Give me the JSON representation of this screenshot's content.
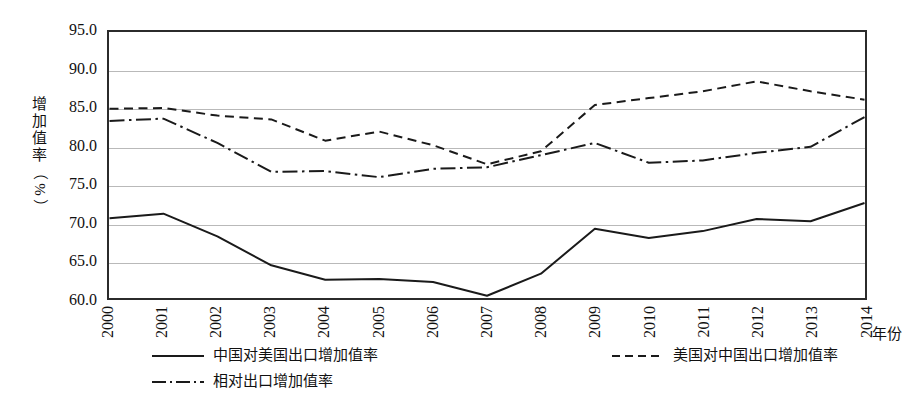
{
  "axes": {
    "y_title_chars": [
      "增",
      "加",
      "值",
      "率",
      "（",
      "%",
      "）"
    ],
    "y_title_text": "增加值率（%）",
    "x_title": "年份",
    "y_ticks": [
      "95.0",
      "90.0",
      "85.0",
      "80.0",
      "75.0",
      "70.0",
      "65.0",
      "60.0"
    ],
    "x_ticks": [
      "2000",
      "2001",
      "2002",
      "2003",
      "2004",
      "2005",
      "2006",
      "2007",
      "2008",
      "2009",
      "2010",
      "2011",
      "2012",
      "2013",
      "2014"
    ]
  },
  "legend": {
    "items": [
      {
        "label": "中国对美国出口增加值率",
        "style": "solid"
      },
      {
        "label": "美国对中国出口增加值率",
        "style": "dashed"
      },
      {
        "label": "相对出口增加值率",
        "style": "dashdot"
      }
    ]
  },
  "chart_data": {
    "type": "line",
    "title": "",
    "xlabel": "年份",
    "ylabel": "增加值率（%）",
    "x": [
      2000,
      2001,
      2002,
      2003,
      2004,
      2005,
      2006,
      2007,
      2008,
      2009,
      2010,
      2011,
      2012,
      2013,
      2014
    ],
    "categories": [
      "2000",
      "2001",
      "2002",
      "2003",
      "2004",
      "2005",
      "2006",
      "2007",
      "2008",
      "2009",
      "2010",
      "2011",
      "2012",
      "2013",
      "2014"
    ],
    "ylim": [
      60.0,
      95.0
    ],
    "ytick_step": 5.0,
    "grid": true,
    "legend_position": "bottom",
    "series": [
      {
        "name": "中国对美国出口增加值率",
        "style": "solid",
        "color": "#1a1a1a",
        "values": [
          70.5,
          71.1,
          68.1,
          64.3,
          62.4,
          62.5,
          62.1,
          60.3,
          63.2,
          69.1,
          67.9,
          68.8,
          70.4,
          70.1,
          72.5
        ]
      },
      {
        "name": "美国对中国出口增加值率",
        "style": "dashed",
        "color": "#1a1a1a",
        "values": [
          84.9,
          85.0,
          84.0,
          83.5,
          80.7,
          81.9,
          80.1,
          77.6,
          79.3,
          85.4,
          86.3,
          87.2,
          88.5,
          87.2,
          86.1
        ]
      },
      {
        "name": "相对出口增加值率",
        "style": "dashdot",
        "color": "#1a1a1a",
        "values": [
          83.3,
          83.6,
          80.4,
          76.6,
          76.7,
          75.9,
          77.0,
          77.2,
          78.8,
          80.4,
          77.8,
          78.1,
          79.1,
          79.9,
          83.8
        ]
      }
    ]
  }
}
